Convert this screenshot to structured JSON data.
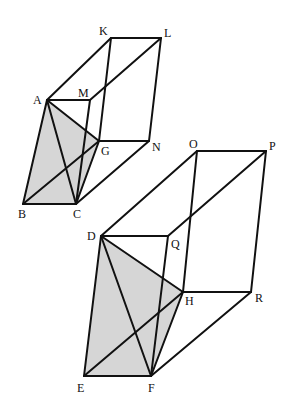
{
  "figures": [
    {
      "name": "upper-prism",
      "shade_color": "#d6d6d6",
      "vertices": {
        "A": [
          47,
          100
        ],
        "M": [
          90,
          100
        ],
        "K": [
          111,
          38
        ],
        "L": [
          161,
          38
        ],
        "G": [
          99,
          141
        ],
        "N": [
          149,
          141
        ],
        "B": [
          23,
          204
        ],
        "C": [
          76,
          204
        ]
      },
      "labels": [
        {
          "text": "K",
          "x": 99,
          "y": 35
        },
        {
          "text": "L",
          "x": 164,
          "y": 37
        },
        {
          "text": "A",
          "x": 33,
          "y": 104
        },
        {
          "text": "M",
          "x": 78,
          "y": 97
        },
        {
          "text": "G",
          "x": 101,
          "y": 155
        },
        {
          "text": "N",
          "x": 152,
          "y": 151
        },
        {
          "text": "B",
          "x": 18,
          "y": 218
        },
        {
          "text": "C",
          "x": 73,
          "y": 218
        }
      ]
    },
    {
      "name": "lower-prism",
      "shade_color": "#d6d6d6",
      "vertices": {
        "D": [
          101,
          236
        ],
        "Q": [
          168,
          236
        ],
        "O": [
          197,
          151
        ],
        "P": [
          266,
          151
        ],
        "H": [
          183,
          292
        ],
        "R": [
          251,
          292
        ],
        "E": [
          84,
          376
        ],
        "F": [
          151,
          376
        ]
      },
      "labels": [
        {
          "text": "O",
          "x": 189,
          "y": 148
        },
        {
          "text": "P",
          "x": 269,
          "y": 150
        },
        {
          "text": "D",
          "x": 87,
          "y": 240
        },
        {
          "text": "Q",
          "x": 171,
          "y": 248
        },
        {
          "text": "H",
          "x": 185,
          "y": 305
        },
        {
          "text": "R",
          "x": 255,
          "y": 302
        },
        {
          "text": "E",
          "x": 77,
          "y": 392
        },
        {
          "text": "F",
          "x": 148,
          "y": 392
        }
      ]
    }
  ]
}
